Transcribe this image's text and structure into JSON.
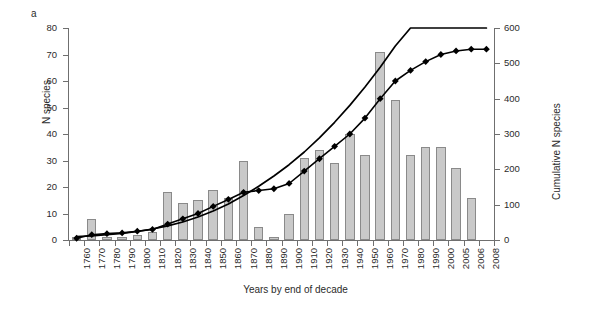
{
  "panel": {
    "label": "a"
  },
  "axis_titles": {
    "left": "N species",
    "right": "Cumulative N species",
    "x": "Years by end of decade"
  },
  "colors": {
    "bar_fill": "#c9c9c9",
    "bar_stroke": "#8a8a8a",
    "line": "#000000",
    "marker": "#000000",
    "axis": "#6f6f6f",
    "text": "#2b2b2b",
    "background": "#ffffff"
  },
  "chart_data": {
    "type": "bar",
    "title": "",
    "subtitle": "",
    "xlabel": "Years by end of decade",
    "ylabel": "N species",
    "y2label": "Cumulative N species",
    "ylim": [
      0,
      80
    ],
    "y2lim": [
      0,
      600
    ],
    "yticks": [
      0,
      10,
      20,
      30,
      40,
      50,
      60,
      70,
      80
    ],
    "y2ticks": [
      0,
      100,
      200,
      300,
      400,
      500,
      600
    ],
    "grid": false,
    "legend": "none",
    "categories": [
      "1760",
      "1770",
      "1780",
      "1790",
      "1800",
      "1810",
      "1820",
      "1830",
      "1840",
      "1850",
      "1860",
      "1870",
      "1880",
      "1890",
      "1900",
      "1910",
      "1920",
      "1930",
      "1940",
      "1950",
      "1960",
      "1970",
      "1980",
      "1990",
      "2000",
      "2005",
      "2006",
      "2008"
    ],
    "series": [
      {
        "name": "N species per decade",
        "type": "bar",
        "axis": "left",
        "values": [
          1,
          8,
          1,
          1,
          2,
          3,
          18,
          14,
          15,
          19,
          16,
          30,
          5,
          1,
          10,
          31,
          34,
          29,
          40,
          32,
          71,
          53,
          32,
          35,
          35,
          27,
          16,
          0
        ]
      },
      {
        "name": "Cumulative N species",
        "type": "line-marker",
        "axis": "right",
        "marker": "diamond",
        "values": [
          5,
          15,
          18,
          20,
          25,
          30,
          45,
          60,
          75,
          95,
          115,
          135,
          140,
          145,
          160,
          195,
          230,
          265,
          300,
          345,
          400,
          450,
          480,
          505,
          525,
          535,
          540,
          540
        ]
      },
      {
        "name": "Fitted exponential trend",
        "type": "line",
        "axis": "right",
        "smooth": true,
        "values": [
          10,
          12,
          15,
          19,
          24,
          31,
          40,
          51,
          65,
          82,
          102,
          126,
          152,
          181,
          213,
          249,
          289,
          333,
          381,
          433,
          489,
          549,
          600,
          600,
          600,
          600,
          600,
          600
        ]
      }
    ]
  }
}
